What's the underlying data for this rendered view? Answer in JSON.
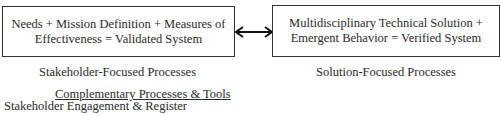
{
  "diagram": {
    "left_box": {
      "line1": "Needs + Mission Definition + Measures of",
      "line2": "Effectiveness = Validated System"
    },
    "right_box": {
      "line1": "Multidisciplinary Technical Solution +",
      "line2": "Emergent Behavior = Verified System"
    },
    "connector": "bidirectional-arrow",
    "left_caption": "Stakeholder-Focused Processes",
    "right_caption": "Solution-Focused Processes",
    "complementary": {
      "title": "Complementary Processes & Tools",
      "items": [
        "Stakeholder Engagement & Register"
      ]
    }
  }
}
